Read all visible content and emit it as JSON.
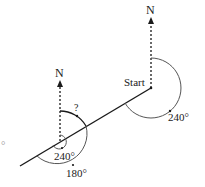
{
  "diagram": {
    "type": "bearings",
    "colors": {
      "line": "#1a1a1a",
      "arc": "#555555",
      "background": "#ffffff"
    },
    "start_point": {
      "label": "Start",
      "north_label": "N",
      "bearing_label": "240°"
    },
    "second_point": {
      "north_label": "N",
      "unknown_label": "?",
      "inner_angle_label": "240°",
      "outer_angle_label": "180°"
    },
    "edge_label": "°"
  }
}
